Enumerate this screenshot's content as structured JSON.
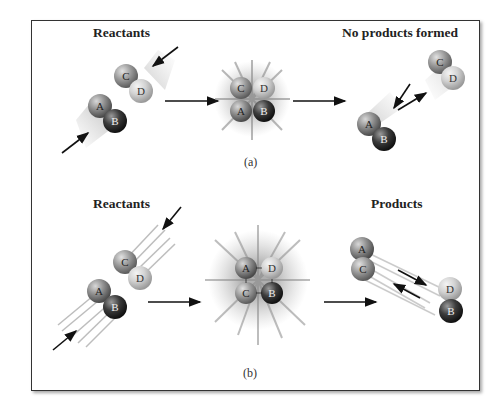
{
  "figure": {
    "panel_a": {
      "caption": "(a)",
      "left_label": "Reactants",
      "right_label": "No products formed",
      "molecules": [
        "A",
        "B",
        "C",
        "D"
      ],
      "outcome": "no reaction - molecules bounce apart"
    },
    "panel_b": {
      "caption": "(b)",
      "left_label": "Reactants",
      "right_label": "Products",
      "molecules": [
        "A",
        "B",
        "C",
        "D"
      ],
      "outcome": "reaction - AC and DB formed"
    },
    "colors": {
      "A": "#8a8a8a",
      "B": "#3a3a3a",
      "C": "#9a9a9a",
      "D": "#d0d0d0",
      "border": "#333333",
      "arrow": "#111111"
    }
  }
}
